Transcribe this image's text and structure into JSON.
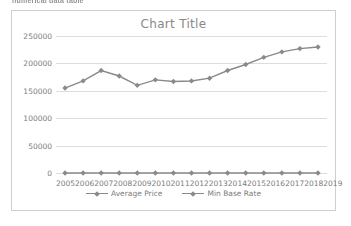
{
  "clipped_caption": "numerical data table",
  "colors": {
    "series_line": "#8a8a8a",
    "gridline": "#dddddd",
    "axis_text": "#7c7c7c",
    "title_text": "#888888",
    "frame_border": "#cfcfcf",
    "plot_background": "#ffffff"
  },
  "chart_data": {
    "type": "line",
    "title": "Chart Title",
    "xlabel": "",
    "ylabel": "",
    "categories": [
      "2005",
      "2006",
      "2007",
      "2008",
      "2009",
      "2010",
      "2011",
      "2012",
      "2013",
      "2014",
      "2015",
      "2016",
      "2017",
      "2018",
      "2019"
    ],
    "ylim": [
      0,
      250000
    ],
    "yticks": [
      0,
      50000,
      100000,
      150000,
      200000,
      250000
    ],
    "ytick_labels": [
      "0",
      "50000",
      "100000",
      "150000",
      "200000",
      "250000"
    ],
    "grid": true,
    "legend_position": "bottom",
    "series": [
      {
        "name": "Average Price",
        "values": [
          155000,
          168000,
          187000,
          177000,
          160000,
          170000,
          167000,
          168000,
          173000,
          187000,
          198000,
          211000,
          221000,
          227000,
          230000
        ]
      },
      {
        "name": "Min Base Rate",
        "values": [
          0,
          0,
          0,
          0,
          0,
          0,
          0,
          0,
          0,
          0,
          0,
          0,
          0,
          0,
          0
        ]
      }
    ]
  }
}
